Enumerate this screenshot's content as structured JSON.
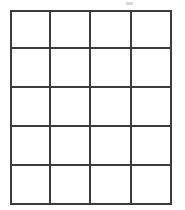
{
  "document": {
    "kind": "scanned-empty-grid-table",
    "background_color": "#ffffff",
    "line_color": "#3c3c3c",
    "smudge_color": "#c9c9c9"
  },
  "table": {
    "columns": 4,
    "rows": 5,
    "total_cells": 20,
    "column_headers": [
      "",
      "",
      "",
      ""
    ],
    "cells": [
      [
        "",
        "",
        "",
        ""
      ],
      [
        "",
        "",
        "",
        ""
      ],
      [
        "",
        "",
        "",
        ""
      ],
      [
        "",
        "",
        "",
        ""
      ],
      [
        "",
        "",
        "",
        ""
      ]
    ]
  },
  "artifacts": {
    "smudge_label": ""
  }
}
